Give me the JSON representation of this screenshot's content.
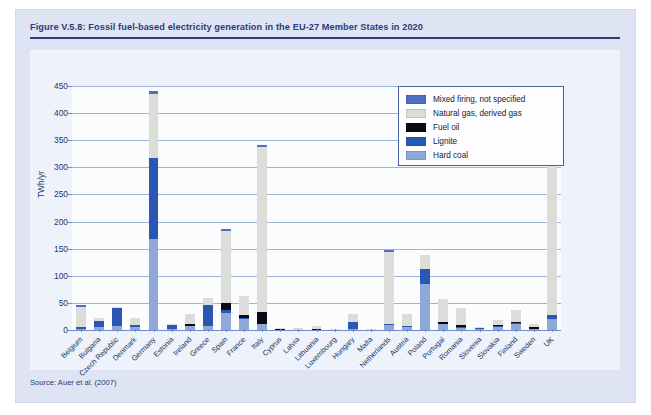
{
  "figure": {
    "title": "Figure V.5.8: Fossil fuel-based electricity generation in the EU-27 Member States in 2020",
    "source": "Source: Auer et al. (2007)"
  },
  "colors": {
    "panel_background": "#dfe4f4",
    "title_text": "#2c3d7b",
    "plot_background": "#fbfcfe",
    "gridline": "#9fb4dd",
    "hard_coal": "#8fa8d8",
    "lignite": "#2b56b4",
    "fuel_oil": "#0a0a14",
    "natural_gas": "#dcdcd8",
    "mixed_firing": "#4e70c0"
  },
  "chart_data": {
    "type": "bar",
    "stacked": true,
    "title": "Fossil fuel-based electricity generation in the EU-27 Member States in 2020",
    "xlabel": "",
    "ylabel": "TWh/yr",
    "ylim": [
      0,
      450
    ],
    "yticks": [
      0,
      50,
      100,
      150,
      200,
      250,
      300,
      350,
      400,
      450
    ],
    "grid": true,
    "legend_position": "top-right",
    "categories": [
      "Belgium",
      "Bulgaria",
      "Czech Republic",
      "Denmark",
      "Germany",
      "Estonia",
      "Ireland",
      "Greece",
      "Spain",
      "France",
      "Italy",
      "Cyprus",
      "Latvia",
      "Lithuania",
      "Luxembourg",
      "Hungary",
      "Malta",
      "Netherlands",
      "Austria",
      "Poland",
      "Portugal",
      "Romania",
      "Slovenia",
      "Slovakia",
      "Finland",
      "Sweden",
      "UK"
    ],
    "series": [
      {
        "name": "Hard coal",
        "color": "#8fa8d8",
        "values": [
          2,
          5,
          7,
          6,
          168,
          1,
          7,
          8,
          31,
          21,
          11,
          0,
          0,
          0,
          0,
          2,
          0,
          9,
          5,
          85,
          12,
          4,
          1,
          5,
          11,
          2,
          21
        ]
      },
      {
        "name": "Lignite",
        "color": "#2b56b4",
        "values": [
          4,
          12,
          34,
          3,
          149,
          8,
          1,
          38,
          6,
          1,
          0,
          0,
          0,
          0,
          0,
          12,
          0,
          2,
          2,
          27,
          0,
          1,
          3,
          3,
          2,
          0,
          7
        ]
      },
      {
        "name": "Fuel oil",
        "color": "#0a0a14",
        "values": [
          0,
          0,
          0,
          1,
          0,
          0,
          3,
          0,
          13,
          5,
          22,
          2,
          0,
          2,
          0,
          0,
          1,
          0,
          1,
          0,
          3,
          4,
          0,
          1,
          1,
          3,
          0
        ]
      },
      {
        "name": "Natural gas, derived gas",
        "color": "#dcdcd8",
        "values": [
          36,
          5,
          2,
          12,
          118,
          1,
          19,
          13,
          133,
          36,
          305,
          2,
          3,
          6,
          2,
          15,
          1,
          133,
          21,
          26,
          42,
          32,
          2,
          9,
          23,
          7,
          316
        ]
      },
      {
        "name": "Mixed firing, not specified",
        "color": "#4e70c0",
        "values": [
          4,
          0,
          0,
          0,
          5,
          0,
          0,
          0,
          3,
          0,
          3,
          0,
          0,
          0,
          0,
          0,
          0,
          4,
          0,
          0,
          0,
          0,
          0,
          0,
          0,
          0,
          0
        ]
      }
    ],
    "totals": [
      46,
      22,
      43,
      22,
      440,
      10,
      30,
      59,
      186,
      63,
      341,
      4,
      3,
      8,
      2,
      29,
      2,
      148,
      29,
      138,
      57,
      41,
      6,
      18,
      37,
      12,
      344
    ]
  },
  "legend": {
    "items": [
      {
        "label": "Mixed firing, not specified",
        "color": "#4e70c0"
      },
      {
        "label": "Natural gas, derived gas",
        "color": "#dcdcd8"
      },
      {
        "label": "Fuel oil",
        "color": "#0a0a14"
      },
      {
        "label": "Lignite",
        "color": "#2b56b4"
      },
      {
        "label": "Hard coal",
        "color": "#8fa8d8"
      }
    ]
  }
}
